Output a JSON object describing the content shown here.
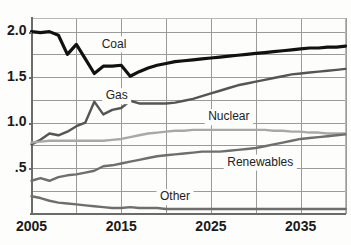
{
  "chart_data": {
    "type": "line",
    "title": "",
    "subtitle": "",
    "xlabel": "",
    "ylabel": "",
    "xlim": [
      2005,
      2040
    ],
    "ylim": [
      0,
      2.15
    ],
    "grid": true,
    "legend_position": "inline-annotations",
    "x_tick_labels": [
      "2005",
      "2015",
      "2025",
      "2035"
    ],
    "x_tick_values": [
      2005,
      2015,
      2025,
      2035
    ],
    "x_gridline_values": [
      2005,
      2010,
      2015,
      2020,
      2025,
      2030,
      2035,
      2040
    ],
    "y_tick_labels": [
      "2.0",
      "1.5",
      "1.0",
      ".5"
    ],
    "y_tick_values": [
      2.0,
      1.5,
      1.0,
      0.5
    ],
    "y_gridline_values": [
      0.25,
      0.5,
      0.75,
      1.0,
      1.25,
      1.5,
      1.75,
      2.0
    ],
    "x": [
      2005,
      2006,
      2007,
      2008,
      2009,
      2010,
      2011,
      2012,
      2013,
      2014,
      2015,
      2016,
      2017,
      2018,
      2019,
      2020,
      2021,
      2022,
      2023,
      2024,
      2025,
      2026,
      2027,
      2028,
      2029,
      2030,
      2031,
      2032,
      2033,
      2034,
      2035,
      2036,
      2037,
      2038,
      2039,
      2040
    ],
    "series": [
      {
        "name": "Coal",
        "color": "#111111",
        "width": 3.2,
        "label_x": 2014.2,
        "label_y": 1.86,
        "values": [
          2.0,
          1.99,
          2.0,
          1.96,
          1.75,
          1.86,
          1.7,
          1.54,
          1.62,
          1.62,
          1.63,
          1.51,
          1.56,
          1.6,
          1.63,
          1.65,
          1.67,
          1.68,
          1.69,
          1.7,
          1.71,
          1.72,
          1.73,
          1.74,
          1.75,
          1.76,
          1.77,
          1.78,
          1.79,
          1.8,
          1.81,
          1.82,
          1.82,
          1.83,
          1.83,
          1.84
        ]
      },
      {
        "name": "Gas",
        "color": "#555555",
        "width": 2.4,
        "label_x": 2014.5,
        "label_y": 1.29,
        "values": [
          0.76,
          0.81,
          0.88,
          0.86,
          0.9,
          0.96,
          1.0,
          1.23,
          1.09,
          1.14,
          1.16,
          1.24,
          1.21,
          1.21,
          1.21,
          1.21,
          1.22,
          1.24,
          1.26,
          1.29,
          1.32,
          1.35,
          1.38,
          1.41,
          1.43,
          1.45,
          1.47,
          1.49,
          1.51,
          1.53,
          1.54,
          1.55,
          1.56,
          1.57,
          1.58,
          1.59
        ]
      },
      {
        "name": "Nuclear",
        "color": "#a8a8a8",
        "width": 2.4,
        "label_x": 2027.0,
        "label_y": 1.06,
        "values": [
          0.78,
          0.79,
          0.8,
          0.8,
          0.8,
          0.8,
          0.8,
          0.8,
          0.8,
          0.81,
          0.82,
          0.84,
          0.86,
          0.88,
          0.89,
          0.9,
          0.91,
          0.91,
          0.92,
          0.92,
          0.92,
          0.92,
          0.92,
          0.92,
          0.92,
          0.92,
          0.92,
          0.91,
          0.91,
          0.9,
          0.9,
          0.89,
          0.89,
          0.88,
          0.88,
          0.88
        ]
      },
      {
        "name": "Renewables",
        "color": "#6e6e6e",
        "width": 2.4,
        "label_x": 2030.5,
        "label_y": 0.56,
        "values": [
          0.36,
          0.39,
          0.36,
          0.4,
          0.42,
          0.43,
          0.45,
          0.47,
          0.52,
          0.53,
          0.55,
          0.57,
          0.59,
          0.61,
          0.63,
          0.64,
          0.65,
          0.66,
          0.67,
          0.68,
          0.68,
          0.68,
          0.69,
          0.7,
          0.71,
          0.72,
          0.74,
          0.76,
          0.78,
          0.8,
          0.82,
          0.83,
          0.84,
          0.85,
          0.86,
          0.87
        ]
      },
      {
        "name": "Other",
        "color": "#6e6e6e",
        "width": 2.4,
        "label_x": 2021.0,
        "label_y": 0.18,
        "values": [
          0.19,
          0.17,
          0.14,
          0.12,
          0.11,
          0.1,
          0.09,
          0.08,
          0.07,
          0.06,
          0.06,
          0.07,
          0.06,
          0.06,
          0.06,
          0.05,
          0.05,
          0.05,
          0.05,
          0.05,
          0.05,
          0.05,
          0.05,
          0.05,
          0.05,
          0.05,
          0.05,
          0.05,
          0.05,
          0.05,
          0.05,
          0.05,
          0.05,
          0.05,
          0.05,
          0.05
        ]
      }
    ]
  },
  "axis_labels": {
    "y": [
      {
        "text": "2.0",
        "value": 2.0
      },
      {
        "text": "1.5",
        "value": 1.5
      },
      {
        "text": "1.0",
        "value": 1.0
      },
      {
        "text": ".5",
        "value": 0.5
      }
    ],
    "x": [
      {
        "text": "2005",
        "value": 2005
      },
      {
        "text": "2015",
        "value": 2015
      },
      {
        "text": "2025",
        "value": 2025
      },
      {
        "text": "2035",
        "value": 2035
      }
    ]
  }
}
